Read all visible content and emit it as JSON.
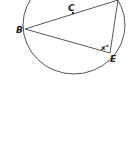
{
  "diagram": {
    "type": "circle-geometry",
    "colors": {
      "stroke": "#555555",
      "text": "#222222",
      "background": "#ffffff"
    },
    "circle": {
      "cx": 74,
      "cy": 25,
      "rx": 51,
      "ry": 49
    },
    "points": {
      "B": {
        "label": "B",
        "x": 25,
        "y": 29
      },
      "C": {
        "label": "C",
        "x": 73,
        "y": 13
      },
      "E": {
        "label": "E",
        "x": 110,
        "y": 53
      },
      "T": {
        "x": 118,
        "y": 0
      }
    },
    "angle_label": "x°",
    "segments": [
      [
        "B",
        "T"
      ],
      [
        "B",
        "E"
      ],
      [
        "T",
        "E"
      ]
    ]
  }
}
